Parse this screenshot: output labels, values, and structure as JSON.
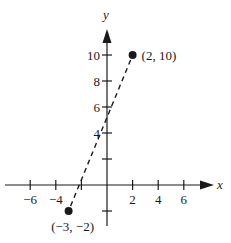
{
  "chart_data": {
    "type": "scatter",
    "title": "",
    "xlabel": "x",
    "ylabel": "y",
    "xlim": [
      -7,
      7.5
    ],
    "ylim": [
      -3,
      12
    ],
    "grid": false,
    "x_ticks": [
      -6,
      -4,
      -2,
      2,
      4,
      6
    ],
    "x_tick_labels": [
      "−6",
      "−4",
      "",
      "2",
      "4",
      "6"
    ],
    "y_ticks": [
      -2,
      2,
      4,
      6,
      8,
      10
    ],
    "y_tick_labels": [
      "",
      "",
      "4",
      "6",
      "8",
      "10"
    ],
    "points": [
      {
        "x": -3,
        "y": -2,
        "label": "(−3, −2)"
      },
      {
        "x": 2,
        "y": 10,
        "label": "(2, 10)"
      }
    ],
    "line": {
      "style": "dashed",
      "from": [
        -3,
        -2
      ],
      "to": [
        2,
        10
      ]
    }
  },
  "axes": {
    "x_label": "x",
    "y_label": "y"
  },
  "colors": {
    "ink": "#1a1a1a",
    "background": "#ffffff"
  }
}
